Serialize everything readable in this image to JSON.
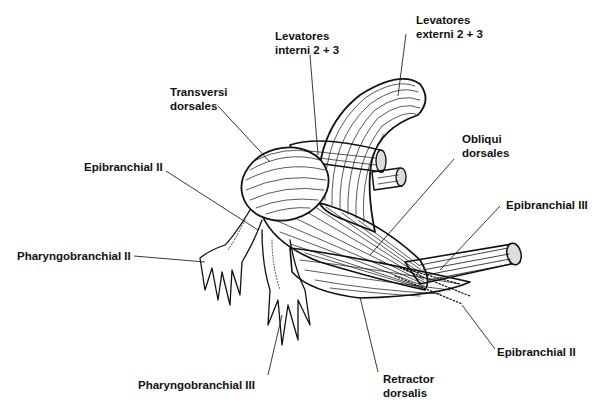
{
  "figure": {
    "type": "anatomical line drawing",
    "colors": {
      "ink": "#111111",
      "background": "#ffffff"
    }
  },
  "labels": {
    "levatores_interni": {
      "line1": "Levatores",
      "line2": "interni 2 + 3"
    },
    "levatores_externi": {
      "line1": "Levatores",
      "line2": "externi 2 + 3"
    },
    "transversi_dorsales": {
      "line1": "Transversi",
      "line2": "dorsales"
    },
    "obliqui_dorsales": {
      "line1": "Obliqui",
      "line2": "dorsales"
    },
    "epibranchial_ii_left": {
      "text": "Epibranchial II"
    },
    "epibranchial_iii": {
      "text": "Epibranchial III"
    },
    "pharyngobranchial_ii": {
      "text": "Pharyngobranchial II"
    },
    "epibranchial_ii_right": {
      "text": "Epibranchial II"
    },
    "pharyngobranchial_iii": {
      "text": "Pharyngobranchial III"
    },
    "retractor_dorsalis": {
      "line1": "Retractor",
      "line2": "dorsalis"
    }
  }
}
